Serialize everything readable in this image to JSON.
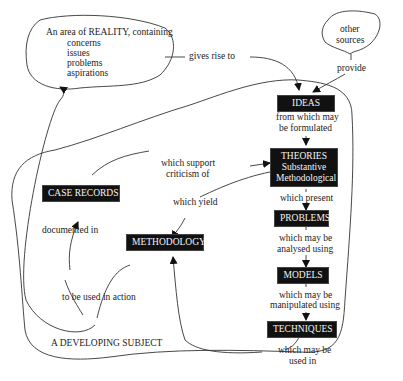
{
  "diagram": {
    "reality_cloud": {
      "heading": "An area of REALITY, containing",
      "items": [
        "concerns",
        "issues",
        "problems",
        "aspirations"
      ]
    },
    "sources_cloud": {
      "label_line1": "other",
      "label_line2": "sources"
    },
    "nodes": {
      "ideas": "IDEAS",
      "theories": {
        "title": "THEORIES",
        "line2": "Substantive",
        "line3": "Methodological"
      },
      "problems": "PROBLEMS",
      "models": "MODELS",
      "techniques": "TECHNIQUES",
      "case_records": "CASE RECORDS",
      "methodology": "METHODOLOGY"
    },
    "edge_labels": {
      "gives_rise_to": "gives rise to",
      "provide": "provide",
      "from_which_1": "from which may",
      "from_which_2": "be formulated",
      "which_support_1": "which support",
      "which_support_2": "criticism of",
      "which_yield": "which yield",
      "which_present": "which present",
      "analysed_1": "which may be",
      "analysed_2": "analysed using",
      "manipulated_1": "which may be",
      "manipulated_2": "manipulated using",
      "used_in_1": "which may be",
      "used_in_2": "used in",
      "documented_in": "documented in",
      "to_be_used": "to be used in action"
    },
    "region_label": "A DEVELOPING SUBJECT"
  }
}
